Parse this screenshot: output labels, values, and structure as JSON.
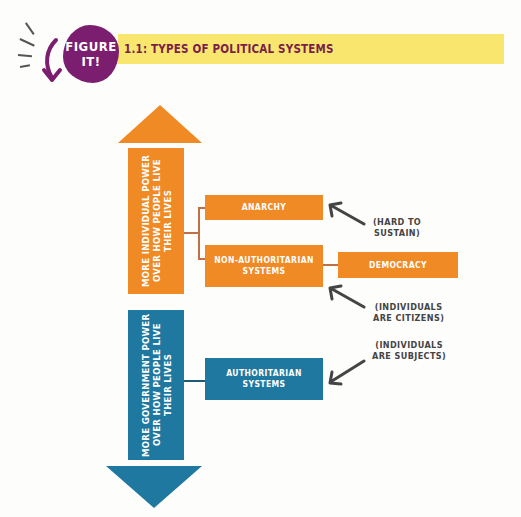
{
  "header": {
    "badge_line1": "FIGURE",
    "badge_line2": "IT!",
    "title": "1.1: TYPES OF POLITICAL SYSTEMS"
  },
  "colors": {
    "badge": "#7b1e6f",
    "title_bar": "#f8e66e",
    "title_text": "#7b1e4a",
    "orange": "#f08a24",
    "blue": "#1f78a0",
    "note_text": "#444444"
  },
  "axis": {
    "top_label": "MORE INDIVIDUAL POWER OVER HOW PEOPLE LIVE THEIR LIVES",
    "bottom_label": "MORE GOVERNMENT POWER OVER HOW PEOPLE LIVE THEIR LIVES"
  },
  "boxes": {
    "anarchy": "ANARCHY",
    "non_authoritarian_1": "NON-AUTHORITARIAN",
    "non_authoritarian_2": "SYSTEMS",
    "democracy": "DEMOCRACY",
    "authoritarian_1": "AUTHORITARIAN",
    "authoritarian_2": "SYSTEMS"
  },
  "notes": {
    "hard_1": "(HARD TO",
    "hard_2": "SUSTAIN)",
    "citizens_1": "(INDIVIDUALS",
    "citizens_2": "ARE CITIZENS)",
    "subjects_1": "(INDIVIDUALS",
    "subjects_2": "ARE SUBJECTS)"
  }
}
